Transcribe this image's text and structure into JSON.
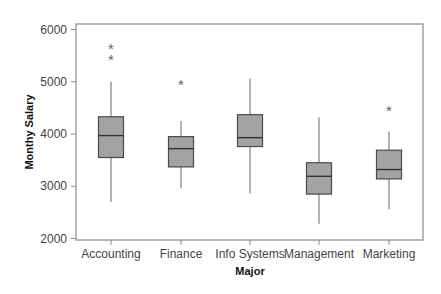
{
  "chart_data": {
    "type": "boxplot",
    "title": "",
    "xlabel": "Major",
    "ylabel": "Monthy Salary",
    "ylim": [
      2000,
      6000
    ],
    "yticks": [
      2000,
      3000,
      4000,
      5000,
      6000
    ],
    "grid": false,
    "legend": null,
    "categories": [
      "Accounting",
      "Finance",
      "Info Systems",
      "Management",
      "Marketing"
    ],
    "series": [
      {
        "name": "Accounting",
        "whisker_low": 2700,
        "q1": 3550,
        "median": 3970,
        "q3": 4330,
        "whisker_high": 5000,
        "outliers": [
          5450,
          5670
        ]
      },
      {
        "name": "Finance",
        "whisker_low": 2960,
        "q1": 3370,
        "median": 3720,
        "q3": 3950,
        "whisker_high": 4250,
        "outliers": [
          4970
        ]
      },
      {
        "name": "Info Systems",
        "whisker_low": 2860,
        "q1": 3760,
        "median": 3930,
        "q3": 4370,
        "whisker_high": 5060,
        "outliers": []
      },
      {
        "name": "Management",
        "whisker_low": 2280,
        "q1": 2850,
        "median": 3190,
        "q3": 3450,
        "whisker_high": 4320,
        "outliers": []
      },
      {
        "name": "Marketing",
        "whisker_low": 2560,
        "q1": 3140,
        "median": 3320,
        "q3": 3690,
        "whisker_high": 4050,
        "outliers": [
          4480
        ]
      }
    ],
    "colors": {
      "box_fill": "#a3a3a3",
      "box_stroke": "#4a4a4a",
      "whisker": "#8a8a8a",
      "frame": "#8a8a8a",
      "outlier": "#666666"
    },
    "outlier_marker": "*"
  }
}
